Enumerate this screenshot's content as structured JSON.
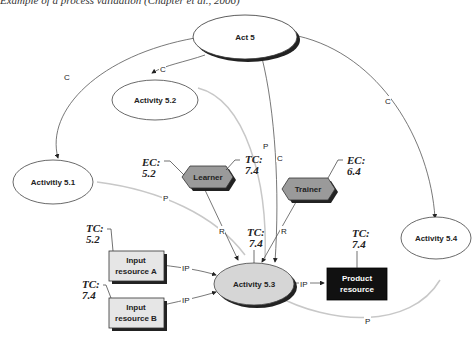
{
  "caption": "Example of a process validation (Chapter et al., 2006)",
  "nodes": {
    "act5": {
      "label": "Act 5"
    },
    "a51": {
      "label": "Activitly 5.1"
    },
    "a52": {
      "label": "Activity 5.2"
    },
    "a53": {
      "label": "Activity 5.3"
    },
    "a54": {
      "label": "Activity 5.4"
    },
    "learner": {
      "label": "Learner",
      "ec_label": "EC:",
      "ec_value": "5.2",
      "tc_label": "TC:",
      "tc_value": "7.4"
    },
    "trainer": {
      "label": "Trainer",
      "ec_label": "EC:",
      "ec_value": "6.4"
    },
    "inputA": {
      "line1": "Input",
      "line2": "resource A",
      "tc_label": "TC:",
      "tc_value": "5.2"
    },
    "inputB": {
      "line1": "Input",
      "line2": "resource B",
      "tc_label": "TC:",
      "tc_value": "7.4"
    },
    "product": {
      "line1": "Product",
      "line2": "resource",
      "tc_label": "TC:",
      "tc_value": "7.4"
    },
    "a53_tc": {
      "tc_label": "TC:",
      "tc_value": "7.4"
    }
  },
  "edge_labels": {
    "c": "C",
    "p": "P",
    "r": "R",
    "ip": "IP"
  },
  "colors": {
    "line_dark": "#555555",
    "line_light": "#c8c8c8",
    "hex_fill": "#9a9a9a",
    "box_fill": "#e6e6e6",
    "product_fill": "#111111",
    "a53_fill": "#d6d6d6"
  }
}
